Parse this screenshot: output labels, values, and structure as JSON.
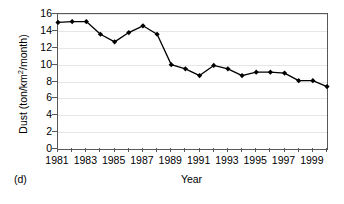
{
  "panel": {
    "label": "(d)"
  },
  "chart_data": {
    "type": "line",
    "title": "",
    "xlabel": "Year",
    "ylabel": "Dust (ton/km2/month)",
    "ylabel_parts": {
      "prefix": "Dust (ton/km",
      "superscript": "2",
      "suffix": "/month)"
    },
    "x": [
      1981,
      1982,
      1983,
      1984,
      1985,
      1986,
      1987,
      1988,
      1989,
      1990,
      1991,
      1992,
      1993,
      1994,
      1995,
      1996,
      1997,
      1998,
      1999,
      2000
    ],
    "values": [
      15.0,
      15.1,
      15.1,
      13.6,
      12.7,
      13.8,
      14.6,
      13.6,
      10.0,
      9.5,
      8.7,
      9.9,
      9.5,
      8.7,
      9.1,
      9.1,
      9.0,
      8.1,
      8.1,
      7.4
    ],
    "series": [
      {
        "name": "Dust",
        "values": [
          15.0,
          15.1,
          15.1,
          13.6,
          12.7,
          13.8,
          14.6,
          13.6,
          10.0,
          9.5,
          8.7,
          9.9,
          9.5,
          8.7,
          9.1,
          9.1,
          9.0,
          8.1,
          8.1,
          7.4
        ]
      }
    ],
    "xlim": [
      1981,
      2000
    ],
    "ylim": [
      0,
      16
    ],
    "yticks": [
      0,
      2,
      4,
      6,
      8,
      10,
      12,
      14,
      16
    ],
    "ytick_labels": [
      "0",
      "2",
      "4",
      "6",
      "8",
      "10",
      "12",
      "14",
      "16"
    ],
    "xticks": [
      1981,
      1982,
      1983,
      1984,
      1985,
      1986,
      1987,
      1988,
      1989,
      1990,
      1991,
      1992,
      1993,
      1994,
      1995,
      1996,
      1997,
      1998,
      1999,
      2000
    ],
    "xtick_labels_shown": [
      "1981",
      "1983",
      "1985",
      "1987",
      "1989",
      "1991",
      "1993",
      "1995",
      "1997",
      "1999"
    ],
    "xtick_label_years": [
      1981,
      1983,
      1985,
      1987,
      1989,
      1991,
      1993,
      1995,
      1997,
      1999
    ],
    "grid": {
      "horizontal": true,
      "vertical": false,
      "color": "#e6e6e6"
    },
    "legend": {
      "visible": false,
      "position": "none"
    },
    "style": {
      "line_color": "#000000",
      "marker": "diamond",
      "marker_color": "#000000",
      "axis_color": "#58585a",
      "background": "#ffffff"
    }
  }
}
